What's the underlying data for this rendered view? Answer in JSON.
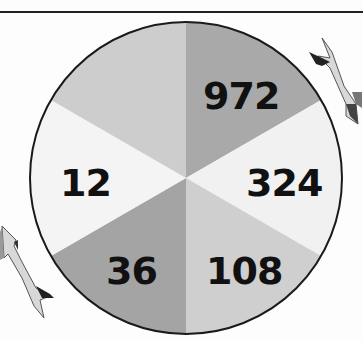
{
  "diagram": {
    "type": "number-wheel",
    "segments": [
      {
        "position": "top-right",
        "label": "972",
        "color": "#a9a9a9"
      },
      {
        "position": "right",
        "label": "324",
        "color": "#f1f1f1"
      },
      {
        "position": "bottom-right",
        "label": "108",
        "color": "#cfcfcf"
      },
      {
        "position": "bottom-left",
        "label": "36",
        "color": "#a4a4a4"
      },
      {
        "position": "left",
        "label": "12",
        "color": "#f4f4f4"
      },
      {
        "position": "top-left",
        "label": "",
        "color": "#cdcdcd"
      }
    ],
    "arrows": [
      {
        "position": "upper-right",
        "direction": "clockwise-down"
      },
      {
        "position": "lower-left",
        "direction": "clockwise-up"
      }
    ]
  }
}
